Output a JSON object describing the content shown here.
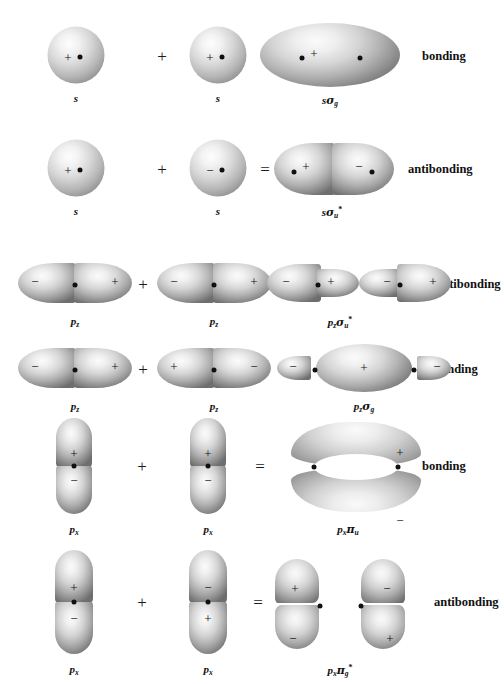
{
  "diagram": {
    "operators": {
      "plus": "+",
      "equals": "="
    },
    "signs": {
      "positive": "+",
      "negative": "−"
    },
    "classification": {
      "bonding": "bonding",
      "antibonding": "antibonding"
    }
  },
  "rows": [
    {
      "id": "row-s-sigma-g",
      "classification": "bonding",
      "operand_a": {
        "label": "s",
        "orbital": "s",
        "lobes": [
          {
            "sign": "+"
          }
        ]
      },
      "operand_b": {
        "label": "s",
        "orbital": "s",
        "lobes": [
          {
            "sign": "+"
          }
        ]
      },
      "result": {
        "label_base": "s",
        "label_greek": "σ",
        "label_sub": "g",
        "label_star": "",
        "label_text": "sσg",
        "orbital": "sigma-bonding",
        "lobes": [
          {
            "sign": "+"
          }
        ]
      }
    },
    {
      "id": "row-s-sigma-u-star",
      "classification": "antibonding",
      "operand_a": {
        "label": "s",
        "orbital": "s",
        "lobes": [
          {
            "sign": "+"
          }
        ]
      },
      "operand_b": {
        "label": "s",
        "orbital": "s",
        "lobes": [
          {
            "sign": "−"
          }
        ]
      },
      "result": {
        "label_base": "s",
        "label_greek": "σ",
        "label_sub": "u",
        "label_star": "*",
        "label_text": "sσu*",
        "orbital": "sigma-antibonding",
        "lobes": [
          {
            "sign": "+"
          },
          {
            "sign": "−"
          }
        ]
      }
    },
    {
      "id": "row-pz-sigma-u-star",
      "classification": "antibonding",
      "operand_a": {
        "label_base": "p",
        "label_sub": "z",
        "label_text": "pz",
        "orbital": "p",
        "lobes": [
          {
            "sign": "−"
          },
          {
            "sign": "+"
          }
        ]
      },
      "operand_b": {
        "label_base": "p",
        "label_sub": "z",
        "label_text": "pz",
        "orbital": "p",
        "lobes": [
          {
            "sign": "−"
          },
          {
            "sign": "+"
          }
        ]
      },
      "result": {
        "label_base": "p",
        "label_base_sub": "z",
        "label_greek": "σ",
        "label_sub": "u",
        "label_star": "*",
        "label_text": "pzσu*",
        "orbital": "sigma-antibonding-p",
        "lobes": [
          {
            "sign": "−"
          },
          {
            "sign": "+"
          },
          {
            "sign": "−"
          },
          {
            "sign": "+"
          }
        ]
      }
    },
    {
      "id": "row-pz-sigma-g",
      "classification": "bonding",
      "operand_a": {
        "label_base": "p",
        "label_sub": "z",
        "label_text": "pz",
        "orbital": "p",
        "lobes": [
          {
            "sign": "−"
          },
          {
            "sign": "+"
          }
        ]
      },
      "operand_b": {
        "label_base": "p",
        "label_sub": "z",
        "label_text": "pz",
        "orbital": "p",
        "lobes": [
          {
            "sign": "+"
          },
          {
            "sign": "−"
          }
        ]
      },
      "result": {
        "label_base": "p",
        "label_base_sub": "z",
        "label_greek": "σ",
        "label_sub": "g",
        "label_star": "",
        "label_text": "pzσg",
        "orbital": "sigma-bonding-p",
        "lobes": [
          {
            "sign": "−"
          },
          {
            "sign": "+"
          },
          {
            "sign": "−"
          }
        ]
      }
    },
    {
      "id": "row-px-pi-u",
      "classification": "bonding",
      "operand_a": {
        "label_base": "p",
        "label_sub": "x",
        "label_text": "px",
        "orbital": "p-vertical",
        "lobes": [
          {
            "sign": "+"
          },
          {
            "sign": "−"
          }
        ]
      },
      "operand_b": {
        "label_base": "p",
        "label_sub": "x",
        "label_text": "px",
        "orbital": "p-vertical",
        "lobes": [
          {
            "sign": "+"
          },
          {
            "sign": "−"
          }
        ]
      },
      "result": {
        "label_base": "p",
        "label_base_sub": "x",
        "label_greek": "π",
        "label_sub": "u",
        "label_star": "",
        "label_text": "pxπu",
        "orbital": "pi-bonding",
        "lobes": [
          {
            "sign": "+"
          },
          {
            "sign": "−"
          }
        ]
      }
    },
    {
      "id": "row-px-pi-g-star",
      "classification": "antibonding",
      "operand_a": {
        "label_base": "p",
        "label_sub": "x",
        "label_text": "px",
        "orbital": "p-vertical",
        "lobes": [
          {
            "sign": "+"
          },
          {
            "sign": "−"
          }
        ]
      },
      "operand_b": {
        "label_base": "p",
        "label_sub": "x",
        "label_text": "px",
        "orbital": "p-vertical",
        "lobes": [
          {
            "sign": "−"
          },
          {
            "sign": "+"
          }
        ]
      },
      "result": {
        "label_base": "p",
        "label_base_sub": "x",
        "label_greek": "π",
        "label_sub": "g",
        "label_star": "*",
        "label_text": "pxπg*",
        "orbital": "pi-antibonding",
        "lobes": [
          {
            "sign": "+"
          },
          {
            "sign": "−"
          },
          {
            "sign": "−"
          },
          {
            "sign": "+"
          }
        ]
      }
    }
  ]
}
